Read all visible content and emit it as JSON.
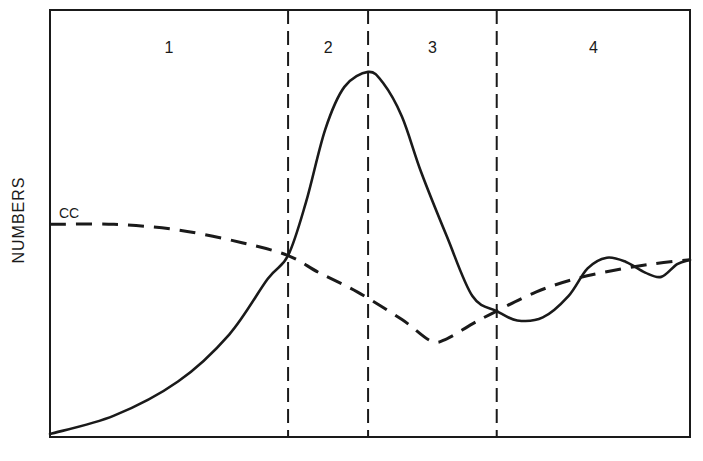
{
  "chart_data": {
    "type": "line",
    "title": "",
    "xlabel": "",
    "ylabel": "NUMBERS",
    "xlim": [
      0,
      100
    ],
    "ylim": [
      0,
      100
    ],
    "grid": false,
    "phases": [
      {
        "label": "1",
        "x_start": 0,
        "x_end": 37.2
      },
      {
        "label": "2",
        "x_start": 37.2,
        "x_end": 49.7
      },
      {
        "label": "3",
        "x_start": 49.7,
        "x_end": 69.8
      },
      {
        "label": "4",
        "x_start": 69.8,
        "x_end": 100
      }
    ],
    "phase_dividers_x": [
      37.2,
      49.7,
      69.8
    ],
    "series": [
      {
        "name": "solid-curve",
        "style": "solid",
        "points": [
          [
            0,
            0.7
          ],
          [
            10,
            5
          ],
          [
            20,
            13
          ],
          [
            28,
            24
          ],
          [
            34,
            37
          ],
          [
            37.2,
            42.5
          ],
          [
            40,
            55
          ],
          [
            43,
            72
          ],
          [
            46,
            82
          ],
          [
            49.7,
            85.5
          ],
          [
            52,
            83
          ],
          [
            55,
            75
          ],
          [
            58,
            62
          ],
          [
            62,
            47
          ],
          [
            66,
            33
          ],
          [
            69.8,
            29.5
          ],
          [
            73,
            27.3
          ],
          [
            77,
            28
          ],
          [
            81,
            33
          ],
          [
            84,
            39.5
          ],
          [
            87,
            42
          ],
          [
            90,
            41
          ],
          [
            93,
            38.5
          ],
          [
            95.5,
            37.5
          ],
          [
            98,
            40.5
          ],
          [
            100,
            41.5
          ]
        ]
      },
      {
        "name": "CC",
        "style": "dashed",
        "label": "CC",
        "points": [
          [
            0,
            49.8
          ],
          [
            10,
            49.8
          ],
          [
            20,
            48.5
          ],
          [
            30,
            45.5
          ],
          [
            37.2,
            42.5
          ],
          [
            42,
            38.5
          ],
          [
            48,
            34
          ],
          [
            55,
            27.5
          ],
          [
            59.5,
            22.5
          ],
          [
            62,
            23
          ],
          [
            66,
            26.5
          ],
          [
            69.8,
            29.5
          ],
          [
            76,
            34
          ],
          [
            82,
            37
          ],
          [
            88,
            39
          ],
          [
            94,
            40.5
          ],
          [
            100,
            41.5
          ]
        ]
      }
    ],
    "annotations": [
      {
        "text": "CC",
        "attached_to": "CC",
        "position": "start"
      }
    ]
  }
}
